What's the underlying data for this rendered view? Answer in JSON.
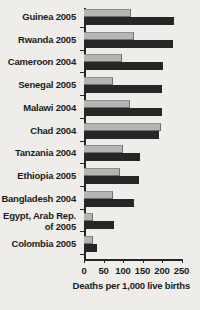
{
  "chart_data": {
    "type": "bar",
    "orientation": "horizontal",
    "title": "",
    "xlabel": "Deaths per 1,000 live births",
    "ylabel": "",
    "xlim": [
      0,
      250
    ],
    "xticks": [
      0,
      50,
      100,
      150,
      200,
      250
    ],
    "xtick_labels": [
      "0",
      "50",
      "100",
      "150",
      "200",
      "250"
    ],
    "grid": false,
    "legend": "none",
    "categories": [
      "Guinea 2005",
      "Rwanda 2005",
      "Cameroon 2004",
      "Senegal 2005",
      "Malawi 2004",
      "Chad 2004",
      "Tanzania 2004",
      "Ethiopia 2005",
      "Bangladesh 2004",
      "Egypt, Arab Rep.\nof 2005",
      "Colombia 2005"
    ],
    "series": [
      {
        "name": "light-bar",
        "color": "#b5b5b3",
        "values": [
          120,
          128,
          98,
          75,
          118,
          198,
          100,
          92,
          75,
          23,
          22
        ]
      },
      {
        "name": "dark-bar",
        "color": "#262626",
        "values": [
          231,
          228,
          202,
          200,
          200,
          192,
          143,
          140,
          128,
          78,
          33
        ]
      }
    ]
  }
}
